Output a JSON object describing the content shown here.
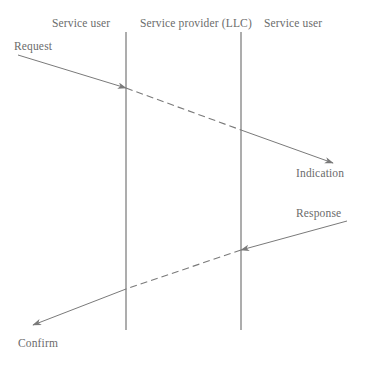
{
  "diagram": {
    "type": "sequence-diagram",
    "title": "",
    "canvas": {
      "width": 365,
      "height": 373,
      "background": "#ffffff"
    },
    "stroke_color": "#7a7a7a",
    "text_color": "#6b6b6b",
    "lanes": [
      {
        "id": "left",
        "label": "Service user",
        "lifeline_x": 126
      },
      {
        "id": "center",
        "label": "Service provider (LLC)",
        "lifeline_x": 241
      },
      {
        "id": "right",
        "label": "Service user",
        "lifeline_x": null
      }
    ],
    "lifelines": [
      {
        "id": "lifeline-left",
        "x": 126,
        "y1": 32,
        "y2": 330
      },
      {
        "id": "lifeline-center",
        "x": 241,
        "y1": 32,
        "y2": 330
      }
    ],
    "messages": [
      {
        "id": "request",
        "label": "Request",
        "style": "solid",
        "from": {
          "x": 18,
          "y": 55
        },
        "to": {
          "x": 126,
          "y": 88
        },
        "arrowhead": "to"
      },
      {
        "id": "request-propagation",
        "label": "",
        "style": "dashed",
        "from": {
          "x": 126,
          "y": 88
        },
        "to": {
          "x": 241,
          "y": 130
        },
        "arrowhead": "none"
      },
      {
        "id": "indication",
        "label": "Indication",
        "style": "solid",
        "from": {
          "x": 241,
          "y": 130
        },
        "to": {
          "x": 333,
          "y": 163
        },
        "arrowhead": "to"
      },
      {
        "id": "response",
        "label": "Response",
        "style": "solid",
        "from": {
          "x": 347,
          "y": 221
        },
        "to": {
          "x": 241,
          "y": 250
        },
        "arrowhead": "to"
      },
      {
        "id": "response-propagation",
        "label": "",
        "style": "dashed",
        "from": {
          "x": 241,
          "y": 250
        },
        "to": {
          "x": 126,
          "y": 289
        },
        "arrowhead": "none"
      },
      {
        "id": "confirm",
        "label": "Confirm",
        "style": "solid",
        "from": {
          "x": 126,
          "y": 289
        },
        "to": {
          "x": 33,
          "y": 325
        },
        "arrowhead": "to"
      }
    ]
  }
}
